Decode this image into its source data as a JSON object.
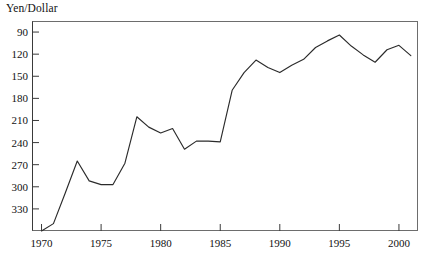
{
  "chart_data": {
    "type": "line",
    "title": "",
    "ylabel": "Yen/Dollar",
    "xlabel": "",
    "y_axis_inverted": true,
    "ylim": [
      360,
      75
    ],
    "xlim": [
      1969.2,
      2001.6
    ],
    "grid": false,
    "legend": null,
    "yticks": [
      90,
      120,
      150,
      180,
      210,
      240,
      270,
      300,
      330
    ],
    "ytick_labels": [
      "90",
      "120",
      "150",
      "180",
      "210",
      "240",
      "270",
      "300",
      "330"
    ],
    "xticks": [
      1970,
      1975,
      1980,
      1985,
      1990,
      1995,
      2000
    ],
    "xtick_labels": [
      "1970",
      "1975",
      "1980",
      "1985",
      "1990",
      "1995",
      "2000"
    ],
    "series": [
      {
        "name": "Yen per Dollar",
        "color": "#2b2b2b",
        "x": [
          1970,
          1971,
          1972,
          1973,
          1974,
          1975,
          1976,
          1977,
          1978,
          1979,
          1980,
          1981,
          1982,
          1983,
          1984,
          1985,
          1986,
          1987,
          1988,
          1989,
          1990,
          1991,
          1992,
          1993,
          1994,
          1995,
          1996,
          1997,
          1998,
          1999,
          2000,
          2001
        ],
        "values": [
          360,
          350,
          308,
          265,
          292,
          297,
          297,
          268,
          205,
          219,
          227,
          221,
          249,
          238,
          238,
          239,
          169,
          145,
          128,
          138,
          145,
          135,
          127,
          111,
          102,
          94,
          109,
          121,
          131,
          114,
          108,
          122
        ]
      }
    ]
  },
  "axis": {
    "y_title": "Yen/Dollar"
  }
}
